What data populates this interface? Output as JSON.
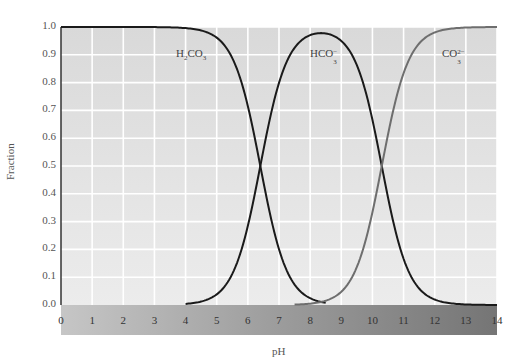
{
  "chart_data": {
    "type": "line",
    "title": "",
    "xlabel": "pH",
    "ylabel": "Fraction",
    "xlim": [
      0,
      14
    ],
    "ylim": [
      0.0,
      1.0
    ],
    "grid": true,
    "legend": "inline labels",
    "x_ticks": [
      "0",
      "1",
      "2",
      "3",
      "4",
      "5",
      "6",
      "7",
      "8",
      "9",
      "10",
      "11",
      "12",
      "13",
      "14"
    ],
    "y_ticks": [
      "0.0",
      "0.1",
      "0.2",
      "0.3",
      "0.4",
      "0.5",
      "0.6",
      "0.7",
      "0.8",
      "0.9",
      "1.0"
    ],
    "pKa1": 6.4,
    "pKa2": 10.3,
    "series": [
      {
        "name": "H2CO3",
        "label": "H₂CO₃",
        "color": "#1a1a1a",
        "x": [
          0,
          4,
          5,
          5.5,
          6,
          6.4,
          7,
          7.5,
          8,
          8.5
        ],
        "y": [
          1.0,
          1.0,
          0.96,
          0.89,
          0.72,
          0.5,
          0.2,
          0.07,
          0.02,
          0.0
        ]
      },
      {
        "name": "HCO3-",
        "label": "HCO₃⁻",
        "color": "#1a1a1a",
        "x": [
          4,
          5,
          5.5,
          6,
          6.4,
          7,
          7.5,
          8,
          8.4,
          9,
          9.5,
          10,
          10.3,
          11,
          11.5,
          12,
          12.5,
          13,
          14
        ],
        "y": [
          0.0,
          0.04,
          0.11,
          0.28,
          0.5,
          0.79,
          0.91,
          0.96,
          0.97,
          0.93,
          0.85,
          0.67,
          0.5,
          0.17,
          0.06,
          0.02,
          0.01,
          0.0,
          0.0
        ]
      },
      {
        "name": "CO3^2-",
        "label": "CO₃²⁻",
        "color": "#6e6e6e",
        "x": [
          7.5,
          8.5,
          9,
          9.5,
          10,
          10.3,
          11,
          11.5,
          12,
          12.5,
          13,
          14
        ],
        "y": [
          0.0,
          0.01,
          0.05,
          0.14,
          0.33,
          0.5,
          0.83,
          0.94,
          0.98,
          0.99,
          1.0,
          1.0
        ]
      }
    ]
  },
  "labels": {
    "ylabel": "Fraction",
    "xlabel": "pH",
    "species": [
      {
        "base": "H",
        "sub1": "2",
        "mid": "CO",
        "sub2": "3",
        "sup": ""
      },
      {
        "base": "HCO",
        "sub2": "3",
        "sup": "−"
      },
      {
        "base": "CO",
        "sub2": "3",
        "sup": "2−"
      }
    ]
  },
  "colors": {
    "plot_bg": "#dedede",
    "grid": "#ffffff",
    "axis_band_start": "#c8c8c8",
    "axis_band_end": "#7a7a7a",
    "curve_dark": "#1a1a1a",
    "curve_gray": "#6e6e6e"
  }
}
